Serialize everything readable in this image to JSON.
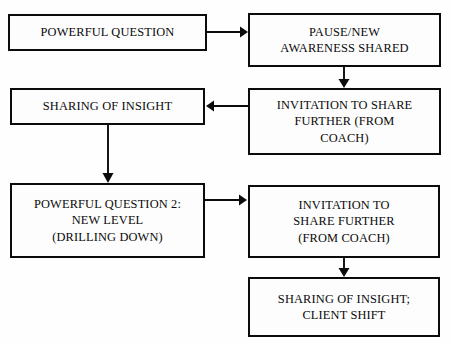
{
  "diagram": {
    "background_color": "#fefefe",
    "line_color": "#0b0b0b",
    "box_fill_color": "#fdfdfd",
    "nodes": [
      {
        "id": "powerful-question",
        "label": "POWERFUL QUESTION",
        "x": 8,
        "y": 14,
        "w": 199,
        "h": 37
      },
      {
        "id": "pause-new-awareness-shared",
        "label": "PAUSE/NEW\nAWARENESS SHARED",
        "x": 248,
        "y": 13,
        "w": 193,
        "h": 54
      },
      {
        "id": "sharing-of-insight",
        "label": "SHARING OF INSIGHT",
        "x": 10,
        "y": 88,
        "w": 195,
        "h": 37
      },
      {
        "id": "invitation-to-share-further-1",
        "label": "INVITATION TO SHARE\nFURTHER (FROM\nCOACH)",
        "x": 248,
        "y": 88,
        "w": 193,
        "h": 67
      },
      {
        "id": "powerful-question-2",
        "label": "POWERFUL QUESTION 2:\nNEW LEVEL\n(DRILLING DOWN)",
        "x": 10,
        "y": 183,
        "w": 195,
        "h": 75
      },
      {
        "id": "invitation-to-share-further-2",
        "label": "INVITATION TO\nSHARE FURTHER\n(FROM COACH)",
        "x": 248,
        "y": 185,
        "w": 192,
        "h": 73
      },
      {
        "id": "sharing-of-insight-client-shift",
        "label": "SHARING OF INSIGHT;\nCLIENT SHIFT",
        "x": 248,
        "y": 277,
        "w": 192,
        "h": 60
      }
    ],
    "edges": [
      {
        "id": "edge-powerful-question-to-pause",
        "from": "powerful-question",
        "to": "pause-new-awareness-shared",
        "direction": "right",
        "x1": 207,
        "y1": 32,
        "x2": 247,
        "y2": 32
      },
      {
        "id": "edge-pause-to-invitation-1",
        "from": "pause-new-awareness-shared",
        "to": "invitation-to-share-further-1",
        "direction": "down",
        "x1": 344,
        "y1": 67,
        "x2": 344,
        "y2": 87
      },
      {
        "id": "edge-invitation-1-to-sharing-insight",
        "from": "invitation-to-share-further-1",
        "to": "sharing-of-insight",
        "direction": "left",
        "x1": 248,
        "y1": 106,
        "x2": 206,
        "y2": 106
      },
      {
        "id": "edge-sharing-insight-to-powerful-question-2",
        "from": "sharing-of-insight",
        "to": "powerful-question-2",
        "direction": "down",
        "x1": 108,
        "y1": 125,
        "x2": 108,
        "y2": 182
      },
      {
        "id": "edge-powerful-question-2-to-invitation-2",
        "from": "powerful-question-2",
        "to": "invitation-to-share-further-2",
        "direction": "right",
        "x1": 205,
        "y1": 200,
        "x2": 247,
        "y2": 200
      },
      {
        "id": "edge-invitation-2-to-client-shift",
        "from": "invitation-to-share-further-2",
        "to": "sharing-of-insight-client-shift",
        "direction": "down",
        "x1": 344,
        "y1": 258,
        "x2": 344,
        "y2": 276
      }
    ]
  }
}
